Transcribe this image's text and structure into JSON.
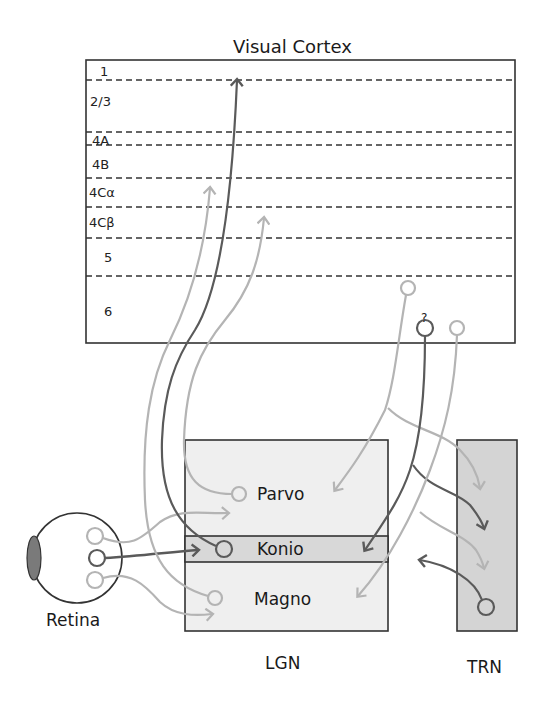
{
  "title": "Visual Cortex",
  "cortex": {
    "layers": [
      {
        "label": "1"
      },
      {
        "label": "2/3"
      },
      {
        "label": "4A"
      },
      {
        "label": "4B"
      },
      {
        "label": "4Cα"
      },
      {
        "label": "4Cβ"
      },
      {
        "label": "5"
      },
      {
        "label": "6"
      }
    ],
    "unknown_marker": "?"
  },
  "lgn": {
    "label": "LGN",
    "layers": {
      "parvo": "Parvo",
      "konio": "Konio",
      "magno": "Magno"
    }
  },
  "trn": {
    "label": "TRN"
  },
  "retina": {
    "label": "Retina"
  },
  "colors": {
    "light_pathway": "#b4b4b4",
    "mid_pathway": "#8c8c8c",
    "dark_pathway": "#5a5a5a",
    "lgn_fill": "#efefef",
    "konio_fill": "#d8d8d8",
    "trn_fill": "#d4d4d4",
    "lens_fill": "#7a7a7a",
    "outline": "#333333"
  }
}
